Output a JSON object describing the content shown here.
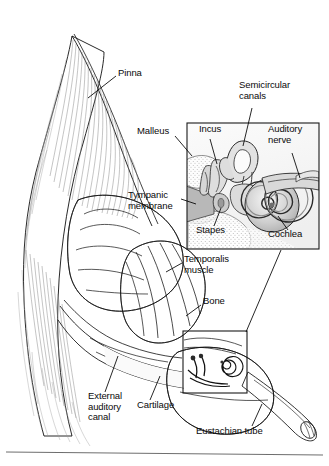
{
  "figure": {
    "background_color": "#ffffff",
    "ink_color": "#111111",
    "inset": {
      "name": "middle-and-inner-ear-inset",
      "box": {
        "x": 186,
        "y": 122,
        "width": 134,
        "height": 128
      },
      "source_box": {
        "x": 182,
        "y": 330,
        "width": 66,
        "height": 64
      }
    },
    "labels": [
      {
        "id": "pinna",
        "text": "Pinna",
        "x": 118,
        "y": 72,
        "align": "left"
      },
      {
        "id": "semicircular",
        "text": "Semicircular\ncanals",
        "x": 239,
        "y": 84,
        "align": "left"
      },
      {
        "id": "malleus",
        "text": "Malleus",
        "x": 137,
        "y": 130,
        "align": "left"
      },
      {
        "id": "incus",
        "text": "Incus",
        "x": 199,
        "y": 128,
        "align": "left"
      },
      {
        "id": "auditory-nerve",
        "text": "Auditory\nnerve",
        "x": 268,
        "y": 128,
        "align": "left"
      },
      {
        "id": "tympanic-membrane",
        "text": "Tympanic\nmembrane",
        "x": 128,
        "y": 194,
        "align": "left"
      },
      {
        "id": "stapes",
        "text": "Stapes",
        "x": 196,
        "y": 229,
        "align": "left"
      },
      {
        "id": "cochlea",
        "text": "Cochlea",
        "x": 268,
        "y": 233,
        "align": "left"
      },
      {
        "id": "temporalis-muscle",
        "text": "Temporalis\nmuscle",
        "x": 184,
        "y": 258,
        "align": "left"
      },
      {
        "id": "bone",
        "text": "Bone",
        "x": 203,
        "y": 300,
        "align": "left"
      },
      {
        "id": "external-auditory-canal",
        "text": "External\nauditory\ncanal",
        "x": 88,
        "y": 395,
        "align": "left"
      },
      {
        "id": "cartilage",
        "text": "Cartilage",
        "x": 137,
        "y": 404,
        "align": "left"
      },
      {
        "id": "eustachian-tube",
        "text": "Eustachian tube",
        "x": 196,
        "y": 430,
        "align": "left"
      }
    ],
    "caption_rule": {
      "x1": 6,
      "y1": 451,
      "x2": 323,
      "y2": 454
    },
    "caption_fragment": ""
  }
}
